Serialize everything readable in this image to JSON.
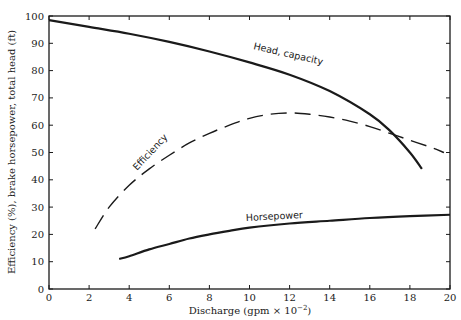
{
  "chart_data": {
    "type": "line",
    "title": "",
    "xlabel": "Discharge (gpm × 10⁻²)",
    "ylabel": "Efficiency (%), brake horsepower, total head (ft)",
    "xlim": [
      0,
      20
    ],
    "ylim": [
      0,
      100
    ],
    "xticks": [
      0,
      2,
      4,
      6,
      8,
      10,
      12,
      14,
      16,
      18,
      20
    ],
    "yticks": [
      0,
      10,
      20,
      30,
      40,
      50,
      60,
      70,
      80,
      90,
      100
    ],
    "grid": false,
    "legend": "inline curve labels",
    "series": [
      {
        "name": "Head, capacity",
        "style": "solid",
        "x": [
          0,
          2,
          4,
          6,
          8,
          10,
          12,
          14,
          16,
          17,
          18,
          18.6
        ],
        "y": [
          98.5,
          96,
          93.5,
          90.5,
          87,
          83,
          78.5,
          72.5,
          64,
          58,
          50,
          44
        ]
      },
      {
        "name": "Efficiency",
        "style": "dashed",
        "x": [
          2.3,
          3,
          4,
          5,
          6,
          7,
          8,
          9,
          10,
          11,
          12,
          13,
          14,
          15,
          16,
          17,
          18,
          19,
          19.7
        ],
        "y": [
          22,
          30,
          38,
          44,
          49,
          53.5,
          57,
          60,
          62.5,
          64,
          64.5,
          64,
          63,
          61.5,
          59.5,
          57,
          54.5,
          52,
          50
        ]
      },
      {
        "name": "Horsepower",
        "style": "solid",
        "x": [
          3.5,
          4,
          5,
          6,
          7,
          8,
          9,
          10,
          12,
          14,
          16,
          18,
          20
        ],
        "y": [
          11,
          12,
          14.5,
          16.5,
          18.5,
          20,
          21.3,
          22.5,
          24,
          25,
          26,
          26.7,
          27.2
        ]
      }
    ],
    "annotations": [
      "Head, capacity",
      "Efficiency",
      "Horsepower"
    ]
  },
  "labels": {
    "xlabel_main": "Discharge (gpm × 10",
    "xlabel_exp": "−2",
    "xlabel_close": ")",
    "ylabel": "Efficiency (%), brake horsepower, total head (ft)",
    "head": "Head, capacity",
    "efficiency": "Efficiency",
    "horsepower": "Horsepower"
  }
}
